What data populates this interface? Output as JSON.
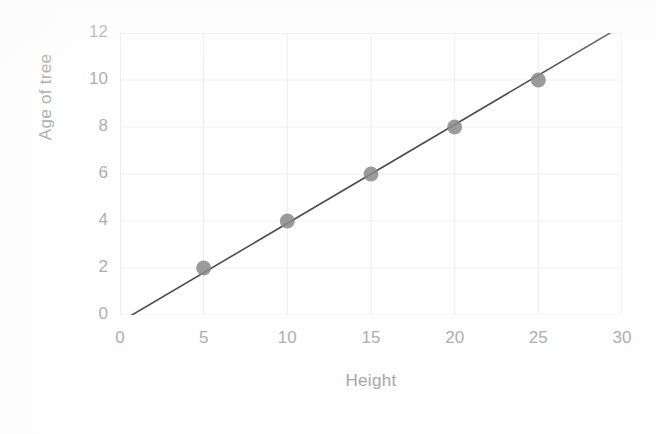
{
  "chart_data": {
    "type": "scatter",
    "title": "",
    "xlabel": "Height",
    "ylabel": "Age of tree",
    "xlim": [
      0,
      30
    ],
    "ylim": [
      0,
      12
    ],
    "xticks": [
      "0",
      "5",
      "10",
      "15",
      "20",
      "25",
      "30"
    ],
    "yticks": [
      "0",
      "2",
      "4",
      "6",
      "8",
      "10",
      "12"
    ],
    "grid": true,
    "legend": "none",
    "x": [
      5,
      10,
      15,
      20,
      25
    ],
    "y": [
      2,
      4,
      6,
      8,
      10
    ],
    "points": [
      {
        "x": 5,
        "y": 2
      },
      {
        "x": 10,
        "y": 4
      },
      {
        "x": 15,
        "y": 6
      },
      {
        "x": 20,
        "y": 8
      },
      {
        "x": 25,
        "y": 10
      }
    ],
    "series": [
      {
        "name": "Age of tree",
        "values": [
          2,
          4,
          6,
          8,
          10
        ]
      }
    ],
    "trendline": {
      "type": "linear",
      "slope": 0.42,
      "intercept": -0.3,
      "x_start": 0,
      "y_start": -0.3,
      "x_end": 30,
      "y_end": 12.3
    },
    "colors": {
      "marker": "#8a8a8a",
      "line": "#4d4d4d",
      "grid": "#ededed",
      "axis_text": "#aeaeae",
      "title_text": "#a6a6a6",
      "background": "#fefefe"
    }
  },
  "axes": {
    "x_title": "Height",
    "y_title": "Age of tree"
  }
}
